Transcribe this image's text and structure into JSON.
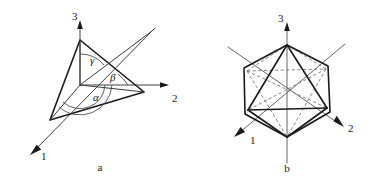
{
  "figure": {
    "background_color": "#ffffff",
    "ink_color": "#1a1a1a",
    "panels": [
      {
        "caption": "a",
        "caption_x": 100,
        "caption_y": 171,
        "description": "Triangular lattice plane intercepting three crystallographic axes, with direction angles alpha, beta and gamma marked at the origin",
        "axes": [
          {
            "label": "1",
            "label_x": 41,
            "label_y": 160,
            "direction": "down-left",
            "arrow": true
          },
          {
            "label": "2",
            "label_x": 172,
            "label_y": 102,
            "direction": "right",
            "arrow": true
          },
          {
            "label": "3",
            "label_x": 72,
            "label_y": 20,
            "direction": "up",
            "arrow": true
          }
        ],
        "angles": [
          {
            "symbol": "γ",
            "name": "gamma",
            "label_x": 90,
            "label_y": 64,
            "between": "axis-3 and plane-normal"
          },
          {
            "symbol": "β",
            "name": "beta",
            "label_x": 110,
            "label_y": 81,
            "between": "axis-2 and plane-normal"
          },
          {
            "symbol": "α",
            "name": "alpha",
            "label_x": 93,
            "label_y": 101,
            "between": "axis-1 and plane-normal"
          }
        ],
        "plane_vertices": [
          {
            "on_axis": "3",
            "x": 80,
            "y": 40
          },
          {
            "on_axis": "2",
            "x": 144,
            "y": 92
          },
          {
            "on_axis": "1",
            "x": 50,
            "y": 120
          }
        ],
        "origin": {
          "x": 80,
          "y": 85
        }
      },
      {
        "caption": "b",
        "caption_x": 287,
        "caption_y": 172,
        "description": "Octahedron inscribed within a hexagonal outline, sharing the same three axes; hidden edges shown dashed",
        "axes": [
          {
            "label": "1",
            "label_x": 250,
            "label_y": 144,
            "direction": "down-left",
            "arrow": true
          },
          {
            "label": "2",
            "label_x": 348,
            "label_y": 132,
            "direction": "down-right",
            "arrow": true
          },
          {
            "label": "3",
            "label_x": 278,
            "label_y": 22,
            "direction": "up",
            "arrow": true
          }
        ],
        "hexagon_vertices": [
          {
            "x": 287,
            "y": 45
          },
          {
            "x": 328,
            "y": 66
          },
          {
            "x": 330,
            "y": 112
          },
          {
            "x": 287,
            "y": 137
          },
          {
            "x": 245,
            "y": 114
          },
          {
            "x": 244,
            "y": 68
          }
        ],
        "octahedron_vertices": [
          {
            "name": "top",
            "x": 287,
            "y": 45
          },
          {
            "name": "bottom",
            "x": 287,
            "y": 137
          },
          {
            "name": "front-left",
            "x": 248,
            "y": 110
          },
          {
            "name": "front-right",
            "x": 327,
            "y": 108
          },
          {
            "name": "back-left",
            "x": 247,
            "y": 71
          },
          {
            "name": "back-right",
            "x": 326,
            "y": 69
          }
        ]
      }
    ]
  }
}
